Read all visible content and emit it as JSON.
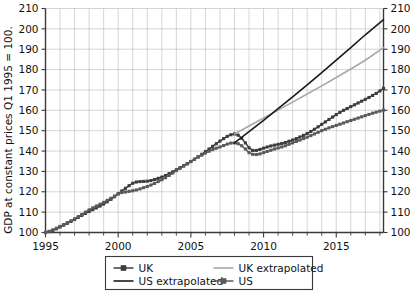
{
  "chart_data": {
    "type": "line",
    "title": "",
    "xlabel": "",
    "ylabel": "GDP at constant prices Q1 1995 = 100.",
    "xlim": [
      1995,
      2018.25
    ],
    "ylim": [
      100,
      210
    ],
    "ytick_labels": [
      "100",
      "110",
      "120",
      "130",
      "140",
      "150",
      "160",
      "170",
      "180",
      "190",
      "200",
      "210"
    ],
    "ytick_values": [
      100,
      110,
      120,
      130,
      140,
      150,
      160,
      170,
      180,
      190,
      200,
      210
    ],
    "xtick_labels": [
      "1995",
      "2000",
      "2005",
      "2010",
      "2015"
    ],
    "xtick_values": [
      1995,
      2000,
      2005,
      2010,
      2015
    ],
    "grid": true,
    "right_axis_labels": [
      "100",
      "110",
      "120",
      "130",
      "140",
      "150",
      "160",
      "170",
      "180",
      "190",
      "200",
      "210"
    ],
    "legend_position": "below",
    "legend": [
      {
        "label": "UK",
        "style": "line-marker",
        "color": "#3c3c3c"
      },
      {
        "label": "UK extrapolated",
        "style": "line",
        "color": "#a8a8a8"
      },
      {
        "label": "US extrapolated",
        "style": "line",
        "color": "#1a1a1a"
      },
      {
        "label": "US",
        "style": "line-marker",
        "color": "#5a5a5a"
      }
    ],
    "series": [
      {
        "name": "UK",
        "color": "#3c3c3c",
        "x": [
          1995,
          1995.25,
          1995.5,
          1995.75,
          1996,
          1996.25,
          1996.5,
          1996.75,
          1997,
          1997.25,
          1997.5,
          1997.75,
          1998,
          1998.25,
          1998.5,
          1998.75,
          1999,
          1999.25,
          1999.5,
          1999.75,
          2000,
          2000.25,
          2000.5,
          2000.75,
          2001,
          2001.25,
          2001.5,
          2001.75,
          2002,
          2002.25,
          2002.5,
          2002.75,
          2003,
          2003.25,
          2003.5,
          2003.75,
          2004,
          2004.25,
          2004.5,
          2004.75,
          2005,
          2005.25,
          2005.5,
          2005.75,
          2006,
          2006.25,
          2006.5,
          2006.75,
          2007,
          2007.25,
          2007.5,
          2007.75,
          2008,
          2008.25,
          2008.5,
          2008.75,
          2009,
          2009.25,
          2009.5,
          2009.75,
          2010,
          2010.25,
          2010.5,
          2010.75,
          2011,
          2011.25,
          2011.5,
          2011.75,
          2012,
          2012.25,
          2012.5,
          2012.75,
          2013,
          2013.25,
          2013.5,
          2013.75,
          2014,
          2014.25,
          2014.5,
          2014.75,
          2015,
          2015.25,
          2015.5,
          2015.75,
          2016,
          2016.25,
          2016.5,
          2016.75,
          2017,
          2017.25,
          2017.5,
          2017.75,
          2018,
          2018.25
        ],
        "y": [
          100,
          100.4,
          101.0,
          101.8,
          102.7,
          103.6,
          104.5,
          105.4,
          106.4,
          107.4,
          108.4,
          109.4,
          110.3,
          111.2,
          112.1,
          113.0,
          114.0,
          115.1,
          116.3,
          117.6,
          119.0,
          120.4,
          121.7,
          123.0,
          124.2,
          124.8,
          125.0,
          125.1,
          125.2,
          125.5,
          126.0,
          126.6,
          127.2,
          128.0,
          128.9,
          129.8,
          130.8,
          131.8,
          132.8,
          133.8,
          134.9,
          136.0,
          137.2,
          138.4,
          139.7,
          141.0,
          142.3,
          143.6,
          144.9,
          146.1,
          147.2,
          148.0,
          148.4,
          147.8,
          146.2,
          144.0,
          141.6,
          140.3,
          140.3,
          140.8,
          141.4,
          142.0,
          142.5,
          142.9,
          143.3,
          143.7,
          144.2,
          144.8,
          145.4,
          146.1,
          146.9,
          147.7,
          148.6,
          149.6,
          150.7,
          151.9,
          153.1,
          154.3,
          155.5,
          156.7,
          157.9,
          159.0,
          160.0,
          160.9,
          161.8,
          162.7,
          163.6,
          164.5,
          165.4,
          166.3,
          167.3,
          168.3,
          169.5,
          170.8
        ]
      },
      {
        "name": "US",
        "color": "#5a5a5a",
        "x": [
          1995,
          1995.25,
          1995.5,
          1995.75,
          1996,
          1996.25,
          1996.5,
          1996.75,
          1997,
          1997.25,
          1997.5,
          1997.75,
          1998,
          1998.25,
          1998.5,
          1998.75,
          1999,
          1999.25,
          1999.5,
          1999.75,
          2000,
          2000.25,
          2000.5,
          2000.75,
          2001,
          2001.25,
          2001.5,
          2001.75,
          2002,
          2002.25,
          2002.5,
          2002.75,
          2003,
          2003.25,
          2003.5,
          2003.75,
          2004,
          2004.25,
          2004.5,
          2004.75,
          2005,
          2005.25,
          2005.5,
          2005.75,
          2006,
          2006.25,
          2006.5,
          2006.75,
          2007,
          2007.25,
          2007.5,
          2007.75,
          2008,
          2008.25,
          2008.5,
          2008.75,
          2009,
          2009.25,
          2009.5,
          2009.75,
          2010,
          2010.25,
          2010.5,
          2010.75,
          2011,
          2011.25,
          2011.5,
          2011.75,
          2012,
          2012.25,
          2012.5,
          2012.75,
          2013,
          2013.25,
          2013.5,
          2013.75,
          2014,
          2014.25,
          2014.5,
          2014.75,
          2015,
          2015.25,
          2015.5,
          2015.75,
          2016,
          2016.25,
          2016.5,
          2016.75,
          2017,
          2017.25,
          2017.5,
          2017.75,
          2018,
          2018.25
        ],
        "y": [
          100,
          100.6,
          101.3,
          102.1,
          103.0,
          103.9,
          104.8,
          105.7,
          106.7,
          107.8,
          108.9,
          110.0,
          111.1,
          112.1,
          113.0,
          113.9,
          114.8,
          115.8,
          116.8,
          117.9,
          119.0,
          119.6,
          119.9,
          120.2,
          120.5,
          120.9,
          121.4,
          122.0,
          122.6,
          123.3,
          124.1,
          125.0,
          125.9,
          126.9,
          128.0,
          129.2,
          130.4,
          131.5,
          132.6,
          133.7,
          134.8,
          135.9,
          137.0,
          138.0,
          139.0,
          139.9,
          140.7,
          141.4,
          142.0,
          142.7,
          143.4,
          143.9,
          144.0,
          143.6,
          142.6,
          141.0,
          139.2,
          138.4,
          138.3,
          138.6,
          139.2,
          139.8,
          140.4,
          141.0,
          141.5,
          142.0,
          142.6,
          143.3,
          144.0,
          144.7,
          145.4,
          146.1,
          146.8,
          147.6,
          148.4,
          149.2,
          150.0,
          150.7,
          151.4,
          152.0,
          152.6,
          153.2,
          153.8,
          154.4,
          155.0,
          155.6,
          156.2,
          156.8,
          157.4,
          158.0,
          158.6,
          159.1,
          159.6,
          160.1
        ]
      },
      {
        "name": "UK extrapolated",
        "color": "#a8a8a8",
        "x": [
          2008,
          2009,
          2010,
          2011,
          2012,
          2013,
          2014,
          2015,
          2016,
          2017,
          2018.25
        ],
        "y": [
          148.4,
          152.3,
          156.2,
          160.1,
          164.0,
          168.0,
          172.0,
          176.1,
          180.3,
          184.6,
          190.8
        ]
      },
      {
        "name": "US extrapolated",
        "color": "#1a1a1a",
        "x": [
          2008,
          2009,
          2010,
          2011,
          2012,
          2013,
          2014,
          2015,
          2016,
          2017,
          2018.25
        ],
        "y": [
          144.0,
          149.5,
          155.1,
          160.8,
          166.6,
          172.5,
          178.5,
          184.6,
          190.8,
          197.1,
          204.5
        ]
      }
    ]
  }
}
